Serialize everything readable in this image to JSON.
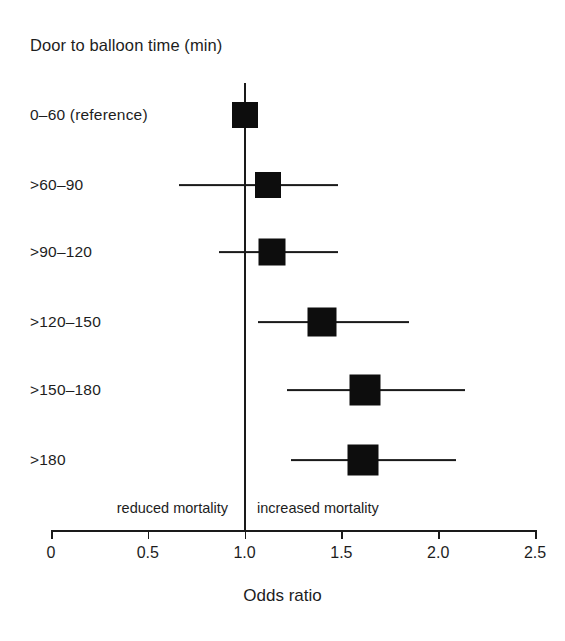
{
  "chart_data": {
    "type": "scatter",
    "subtype": "forest-plot",
    "title": "Door to balloon time (min)",
    "xlabel": "Odds ratio",
    "ylabel": "",
    "xlim": [
      0,
      2.5
    ],
    "xticks": [
      "0",
      "0.5",
      "1.0",
      "1.5",
      "2.0",
      "2.5"
    ],
    "xtick_values": [
      0,
      0.5,
      1.0,
      1.5,
      2.0,
      2.5
    ],
    "grid": false,
    "legend": false,
    "reference_line": 1.0,
    "categories": [
      "0–60 (reference)",
      ">60–90",
      ">90–120",
      ">120–150",
      ">150–180",
      ">180"
    ],
    "values": [
      1.0,
      1.12,
      1.14,
      1.4,
      1.62,
      1.61
    ],
    "ci_low": [
      null,
      0.66,
      0.87,
      1.07,
      1.22,
      1.24
    ],
    "ci_high": [
      null,
      1.48,
      1.48,
      1.85,
      2.14,
      2.09
    ],
    "points": [
      {
        "label": "0–60 (reference)",
        "odds_ratio": 1.0,
        "ci_low": null,
        "ci_high": null,
        "reference": true
      },
      {
        "label": ">60–90",
        "odds_ratio": 1.12,
        "ci_low": 0.66,
        "ci_high": 1.48,
        "reference": false
      },
      {
        "label": ">90–120",
        "odds_ratio": 1.14,
        "ci_low": 0.87,
        "ci_high": 1.48,
        "reference": false
      },
      {
        "label": ">120–150",
        "odds_ratio": 1.4,
        "ci_low": 1.07,
        "ci_high": 1.85,
        "reference": false
      },
      {
        "label": ">150–180",
        "odds_ratio": 1.62,
        "ci_low": 1.22,
        "ci_high": 2.14,
        "reference": false
      },
      {
        "label": ">180",
        "odds_ratio": 1.61,
        "ci_low": 1.24,
        "ci_high": 2.09,
        "reference": false
      }
    ],
    "annotations": {
      "left_of_reference": "reduced mortality",
      "right_of_reference": "increased mortality"
    },
    "colors": {
      "marker": "#0d0d0d",
      "line": "#1a1a1a",
      "text": "#1d1d1d",
      "background": "#ffffff"
    }
  },
  "layout": {
    "rows_y": [
      115,
      185,
      252,
      322,
      390,
      460
    ],
    "marker_sizes": [
      26,
      26,
      27,
      29,
      31,
      31
    ],
    "axis": {
      "x_left_px": 51,
      "x_right_px": 535,
      "baseline_y": 530
    },
    "annotation_y": 508
  }
}
